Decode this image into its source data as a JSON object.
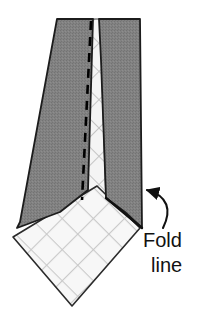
{
  "figure": {
    "annotation": {
      "line1": "Fold",
      "line2": "line",
      "full_text": "Fold line",
      "arrow": "curved-arrow-pointing-left"
    }
  },
  "colors": {
    "background": "#ffffff",
    "tie_gray": "#808080",
    "tie_gray_shade": "#6e6e6e",
    "outline": "#1a1a1a",
    "lining_white": "#f7f7f7",
    "plaid_line": "#c9c9c9",
    "plaid_line_dark": "#b3b3b3",
    "dashed_seam": "#000000",
    "text": "#111111"
  },
  "parts": [
    {
      "name": "tie-left-panel",
      "fill": "tie_gray"
    },
    {
      "name": "tie-right-panel",
      "fill": "tie_gray"
    },
    {
      "name": "center-lining-strip",
      "fill": "lining_white"
    },
    {
      "name": "folded-tip-diamond",
      "fill": "lining_white"
    },
    {
      "name": "seam-dashed-line",
      "stroke": "dashed_seam"
    },
    {
      "name": "fold-line-edge",
      "stroke": "outline"
    }
  ],
  "geometry": {
    "tie_top_y": 19,
    "tie_left_tip": [
      17,
      228
    ],
    "tie_right_corner": [
      142,
      228
    ],
    "diamond_bottom_tip": [
      72,
      306
    ],
    "diamond_left_corner": [
      13,
      237
    ],
    "diamond_right_corner": [
      140,
      228
    ]
  }
}
